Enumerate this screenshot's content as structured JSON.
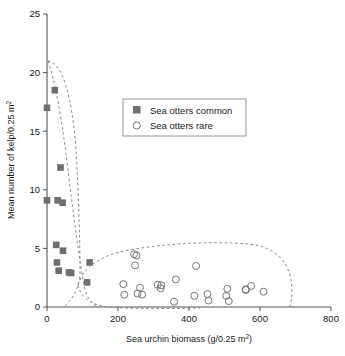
{
  "chart_data": {
    "type": "scatter",
    "title": "",
    "xlabel": "Sea urchin biomass (g/0.25 m",
    "xlabel_sup": "2",
    "xlabel_tail": ")",
    "ylabel": "Mean number of kelp/0.25 m",
    "ylabel_sup": "2",
    "xlim": [
      0,
      800
    ],
    "ylim": [
      0,
      25
    ],
    "xticks": [
      0,
      200,
      400,
      600,
      800
    ],
    "yticks": [
      0,
      5,
      10,
      15,
      20,
      25
    ],
    "xtick_labels": [
      "0",
      "200",
      "400",
      "600",
      "800"
    ],
    "ytick_labels": [
      "0",
      "5",
      "10",
      "15",
      "20",
      "25"
    ],
    "grid": false,
    "legend_position": "upper-center",
    "series": [
      {
        "name": "Sea otters common",
        "marker": "filled-square",
        "color": "#6e6e6e",
        "points": [
          [
            0,
            17.0
          ],
          [
            22,
            18.5
          ],
          [
            38,
            11.9
          ],
          [
            0,
            9.1
          ],
          [
            30,
            9.1
          ],
          [
            44,
            8.9
          ],
          [
            26,
            5.3
          ],
          [
            45,
            4.8
          ],
          [
            28,
            3.8
          ],
          [
            120,
            3.8
          ],
          [
            33,
            3.1
          ],
          [
            62,
            2.95
          ],
          [
            68,
            2.9
          ],
          [
            113,
            2.1
          ]
        ]
      },
      {
        "name": "Sea otters rare",
        "marker": "open-circle",
        "color": "#6e6e6e",
        "points": [
          [
            245,
            4.5
          ],
          [
            252,
            4.4
          ],
          [
            248,
            3.55
          ],
          [
            420,
            3.5
          ],
          [
            363,
            2.35
          ],
          [
            215,
            1.95
          ],
          [
            312,
            1.9
          ],
          [
            322,
            1.85
          ],
          [
            262,
            1.65
          ],
          [
            320,
            1.6
          ],
          [
            508,
            1.55
          ],
          [
            560,
            1.5
          ],
          [
            575,
            1.8
          ],
          [
            610,
            1.3
          ],
          [
            218,
            1.05
          ],
          [
            255,
            1.15
          ],
          [
            268,
            1.05
          ],
          [
            415,
            0.95
          ],
          [
            452,
            1.1
          ],
          [
            455,
            0.55
          ],
          [
            505,
            0.95
          ],
          [
            512,
            0.5
          ],
          [
            358,
            0.45
          ],
          [
            560,
            1.45
          ]
        ]
      }
    ],
    "envelopes": [
      {
        "name": "sea-otters-common-envelope",
        "style": "dashed"
      },
      {
        "name": "sea-otters-rare-envelope",
        "style": "dashed"
      }
    ]
  },
  "legend": {
    "items": [
      {
        "label": "Sea otters common",
        "marker": "filled-square"
      },
      {
        "label": "Sea otters rare",
        "marker": "open-circle"
      }
    ]
  },
  "colors": {
    "marker": "#6e6e6e",
    "axis": "#555555",
    "text": "#1a1a1a",
    "dash": "#888888"
  }
}
